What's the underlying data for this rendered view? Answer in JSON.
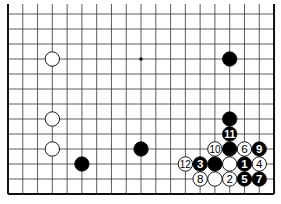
{
  "diagram": {
    "board": {
      "columns": 19,
      "rows_visible": 13,
      "edges": [
        "left",
        "right",
        "bottom"
      ],
      "origin_x": 8,
      "origin_y": 14,
      "step_x": 14.78,
      "step_y": 15,
      "line_color": "#333333",
      "edge_color": "#111111"
    },
    "star_points": [
      {
        "col": 9,
        "row": 3
      }
    ],
    "stones": [
      {
        "color": "white",
        "col": 3,
        "row": 3,
        "label": ""
      },
      {
        "color": "black",
        "col": 15,
        "row": 3,
        "label": ""
      },
      {
        "color": "white",
        "col": 3,
        "row": 7,
        "label": ""
      },
      {
        "color": "white",
        "col": 3,
        "row": 9,
        "label": ""
      },
      {
        "color": "black",
        "col": 5,
        "row": 10,
        "label": ""
      },
      {
        "color": "black",
        "col": 9,
        "row": 9,
        "label": ""
      },
      {
        "color": "black",
        "col": 15,
        "row": 7,
        "label": ""
      },
      {
        "color": "black",
        "col": 15,
        "row": 8,
        "label": "11"
      },
      {
        "color": "white",
        "col": 14,
        "row": 9,
        "label": "10"
      },
      {
        "color": "black",
        "col": 15,
        "row": 9,
        "label": ""
      },
      {
        "color": "white",
        "col": 16,
        "row": 9,
        "label": "6"
      },
      {
        "color": "black",
        "col": 17,
        "row": 9,
        "label": "9"
      },
      {
        "color": "white",
        "col": 12,
        "row": 10,
        "label": "12"
      },
      {
        "color": "black",
        "col": 13,
        "row": 10,
        "label": "3"
      },
      {
        "color": "black",
        "col": 14,
        "row": 10,
        "label": ""
      },
      {
        "color": "white",
        "col": 15,
        "row": 10,
        "label": ""
      },
      {
        "color": "black",
        "col": 16,
        "row": 10,
        "label": "1"
      },
      {
        "color": "white",
        "col": 17,
        "row": 10,
        "label": "4"
      },
      {
        "color": "white",
        "col": 13,
        "row": 11,
        "label": "8"
      },
      {
        "color": "white",
        "col": 14,
        "row": 11,
        "label": ""
      },
      {
        "color": "white",
        "col": 15,
        "row": 11,
        "label": "2"
      },
      {
        "color": "black",
        "col": 16,
        "row": 11,
        "label": "5"
      },
      {
        "color": "black",
        "col": 17,
        "row": 11,
        "label": "7"
      }
    ]
  }
}
